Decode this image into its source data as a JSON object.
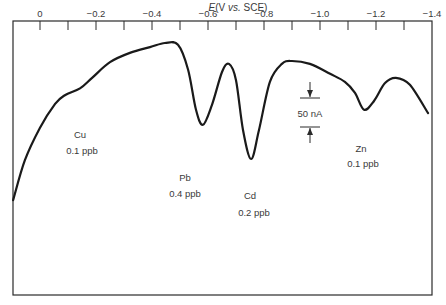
{
  "chart_data": {
    "type": "line",
    "title": "",
    "xlabel_prefix": "E",
    "xlabel": "E (V vs. SCE)",
    "xlabel_rest": "(V ",
    "xlabel_vs": "vs.",
    "xlabel_tail": " SCE)",
    "ylabel": "",
    "xlim": [
      0.096,
      -1.4
    ],
    "x_axis_position": "top",
    "grid": false,
    "legend": null,
    "x_ticks_labeled": [
      {
        "value": 0,
        "label": "0"
      },
      {
        "value": -0.2,
        "label": "−0.2"
      },
      {
        "value": -0.4,
        "label": "−0.4"
      },
      {
        "value": -0.6,
        "label": "−0.6"
      },
      {
        "value": -0.8,
        "label": "−0.8"
      },
      {
        "value": -1.0,
        "label": "−1.0"
      },
      {
        "value": -1.2,
        "label": "−1.2"
      },
      {
        "value": -1.4,
        "label": "−1.4"
      }
    ],
    "x_ticks_minor": [
      -0.1,
      -0.3,
      -0.5,
      -0.7,
      -0.9,
      -1.1,
      -1.3
    ],
    "series": [
      {
        "name": "Anodic stripping voltammogram",
        "x": [
          0.096,
          0.054,
          0.0,
          -0.054,
          -0.089,
          -0.143,
          -0.186,
          -0.25,
          -0.321,
          -0.393,
          -0.446,
          -0.493,
          -0.529,
          -0.557,
          -0.582,
          -0.614,
          -0.65,
          -0.675,
          -0.7,
          -0.725,
          -0.754,
          -0.782,
          -0.821,
          -0.864,
          -0.9,
          -0.964,
          -1.036,
          -1.089,
          -1.125,
          -1.157,
          -1.193,
          -1.232,
          -1.271,
          -1.321,
          -1.386
        ],
        "y": [
          -309,
          -240,
          -184,
          -143,
          -128,
          -116,
          -98,
          -71,
          -55,
          -45,
          -38,
          -41,
          -84,
          -153,
          -179,
          -145,
          -88,
          -74,
          -102,
          -188,
          -238,
          -188,
          -105,
          -74,
          -69,
          -74,
          -91,
          -105,
          -124,
          -153,
          -138,
          -107,
          -98,
          -110,
          -159
        ],
        "y_units": "nA (relative)"
      }
    ],
    "annotations": [
      {
        "element": "Cu",
        "concentration": "0.1 ppb"
      },
      {
        "element": "Pb",
        "concentration": "0.4 ppb",
        "peak_potential": -0.58
      },
      {
        "element": "Cd",
        "concentration": "0.2 ppb",
        "peak_potential": -0.75
      },
      {
        "element": "Zn",
        "concentration": "0.1 ppb",
        "peak_potential": -1.16
      }
    ],
    "scale_bar": {
      "label": "50 nA",
      "value_nA": 50
    }
  },
  "labels": {
    "cu": {
      "name": "Cu",
      "conc": "0.1 ppb"
    },
    "pb": {
      "name": "Pb",
      "conc": "0.4 ppb"
    },
    "cd": {
      "name": "Cd",
      "conc": "0.2 ppb"
    },
    "zn": {
      "name": "Zn",
      "conc": "0.1 ppb"
    },
    "scale": "50 nA"
  },
  "colors": {
    "line": "#1a1a1a",
    "frame": "#2a2a2a",
    "text": "#3a3a3a"
  }
}
